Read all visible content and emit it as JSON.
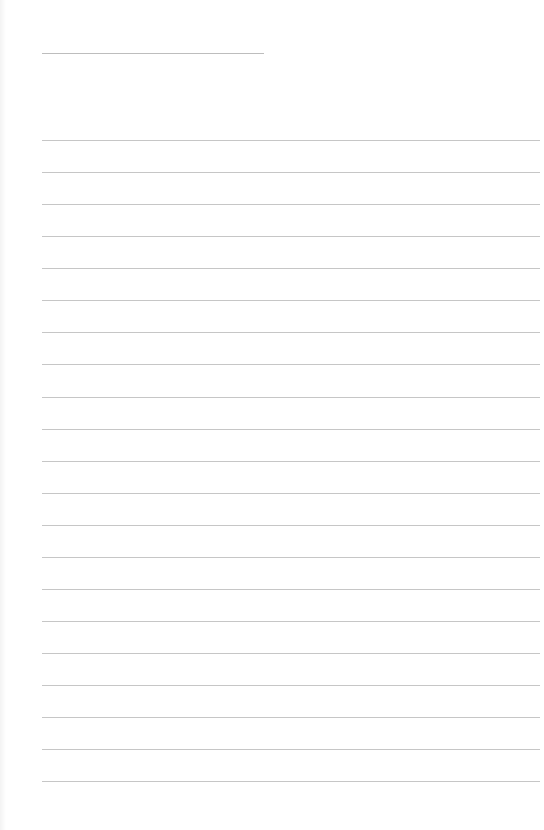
{
  "page": {
    "type": "lined-notebook-page",
    "background_color": "#ffffff",
    "line_color": "#c6c6c6"
  },
  "title_line": {
    "x": 42,
    "y": 53,
    "width": 222
  },
  "ruled_lines": {
    "count": 21,
    "x": 42,
    "width": 498,
    "positions": [
      140,
      172,
      204,
      236,
      268,
      300,
      332,
      364,
      397,
      429,
      461,
      493,
      525,
      557,
      589,
      621,
      653,
      685,
      717,
      749,
      781
    ]
  },
  "footer": {
    "text": ""
  }
}
